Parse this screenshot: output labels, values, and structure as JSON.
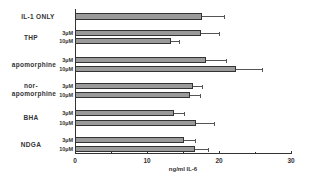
{
  "chart_data": {
    "type": "bar",
    "orientation": "horizontal",
    "title": "",
    "xlabel": "ng/ml IL-6",
    "ylabel": "",
    "xlim": [
      0,
      30
    ],
    "x_ticks": [
      "0",
      "10",
      "20",
      "30"
    ],
    "grid": false,
    "legend": null,
    "groups": [
      {
        "label": "IL-1 ONLY",
        "bars": [
          {
            "conc": "",
            "value": 17.6,
            "error": 3.1
          }
        ]
      },
      {
        "label": "THP",
        "bars": [
          {
            "conc": "3µM",
            "value": 17.5,
            "error": 2.5
          },
          {
            "conc": "10µM",
            "value": 13.3,
            "error": 1.1
          }
        ]
      },
      {
        "label": "apomorphine",
        "bars": [
          {
            "conc": "3µM",
            "value": 18.2,
            "error": 2.8
          },
          {
            "conc": "10µM",
            "value": 22.4,
            "error": 3.6
          }
        ]
      },
      {
        "label": "nor-apomorphine",
        "label_lines": [
          "nor-",
          "apomorphine"
        ],
        "bars": [
          {
            "conc": "3µM",
            "value": 16.4,
            "error": 1.2
          },
          {
            "conc": "10µM",
            "value": 16.0,
            "error": 1.3
          }
        ]
      },
      {
        "label": "BHA",
        "bars": [
          {
            "conc": "3µM",
            "value": 13.8,
            "error": 1.3
          },
          {
            "conc": "10µM",
            "value": 16.8,
            "error": 2.5
          }
        ]
      },
      {
        "label": "NDGA",
        "bars": [
          {
            "conc": "3µM",
            "value": 15.1,
            "error": 1.6
          },
          {
            "conc": "10µM",
            "value": 16.7,
            "error": 1.8
          }
        ]
      }
    ]
  },
  "labels": {
    "il1": "IL-1 ONLY",
    "thp": "THP",
    "apo": "apomorphine",
    "nor1": "nor-",
    "nor2": "apomorphine",
    "bha": "BHA",
    "ndga": "NDGA",
    "c3": "3µM",
    "c10": "10µM",
    "t0": "0",
    "t10": "10",
    "t20": "20",
    "t30": "30",
    "xlabel": "ng/ml IL-6"
  }
}
